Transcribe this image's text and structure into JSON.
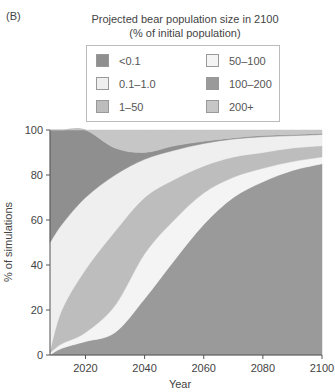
{
  "panel_label": "(B)",
  "legend": {
    "title_line1": "Projected bear population size in 2100",
    "title_line2": "(% of initial population)",
    "items": [
      {
        "label": "<0.1",
        "color": "#8f8f8f",
        "col": 0,
        "row": 0
      },
      {
        "label": "0.1–1.0",
        "color": "#efefef",
        "col": 0,
        "row": 1
      },
      {
        "label": "1–50",
        "color": "#bdbdbd",
        "col": 0,
        "row": 2
      },
      {
        "label": "50–100",
        "color": "#f4f4f4",
        "col": 1,
        "row": 0
      },
      {
        "label": "100–200",
        "color": "#9a9a9a",
        "col": 1,
        "row": 1
      },
      {
        "label": "200+",
        "color": "#c6c6c6",
        "col": 1,
        "row": 2
      }
    ]
  },
  "chart_data": {
    "type": "area",
    "stacked": true,
    "xlabel": "Year",
    "ylabel": "% of simulations",
    "xlim": [
      2008,
      2100
    ],
    "ylim": [
      0,
      100
    ],
    "xticks": [
      2020,
      2040,
      2060,
      2080,
      2100
    ],
    "yticks": [
      0,
      20,
      40,
      60,
      80,
      100
    ],
    "grid": false,
    "legend_position": "top",
    "x": [
      2008,
      2012,
      2020,
      2030,
      2040,
      2050,
      2060,
      2070,
      2080,
      2090,
      2100
    ],
    "series": [
      {
        "name": "100–200",
        "color": "#9a9a9a",
        "values": [
          0,
          3,
          6,
          10,
          25,
          42,
          58,
          70,
          77,
          82,
          85
        ]
      },
      {
        "name": "50–100",
        "color": "#f4f4f4",
        "values": [
          1,
          2,
          4,
          12,
          20,
          18,
          14,
          9,
          6,
          4,
          3
        ]
      },
      {
        "name": "1–50",
        "color": "#bdbdbd",
        "values": [
          1,
          15,
          28,
          33,
          25,
          18,
          12,
          9,
          7,
          6,
          5
        ]
      },
      {
        "name": "0.1–1.0",
        "color": "#efefef",
        "values": [
          48,
          38,
          32,
          25,
          17,
          13,
          10,
          8,
          7,
          5.5,
          5
        ]
      },
      {
        "name": "<0.1",
        "color": "#8f8f8f",
        "values": [
          50,
          42,
          30,
          12,
          3,
          2,
          1,
          0.5,
          0.5,
          0.5,
          0.5
        ]
      },
      {
        "name": "200+",
        "color": "#c6c6c6",
        "values": [
          0,
          0,
          0,
          8,
          10,
          7,
          5,
          3.5,
          2.5,
          2,
          1.5
        ]
      }
    ]
  },
  "axes": {
    "x_ticks": [
      "2020",
      "2040",
      "2060",
      "2080",
      "2100"
    ],
    "y_ticks": [
      "0",
      "20",
      "40",
      "60",
      "80",
      "100"
    ],
    "xlabel": "Year",
    "ylabel": "% of simulations"
  }
}
